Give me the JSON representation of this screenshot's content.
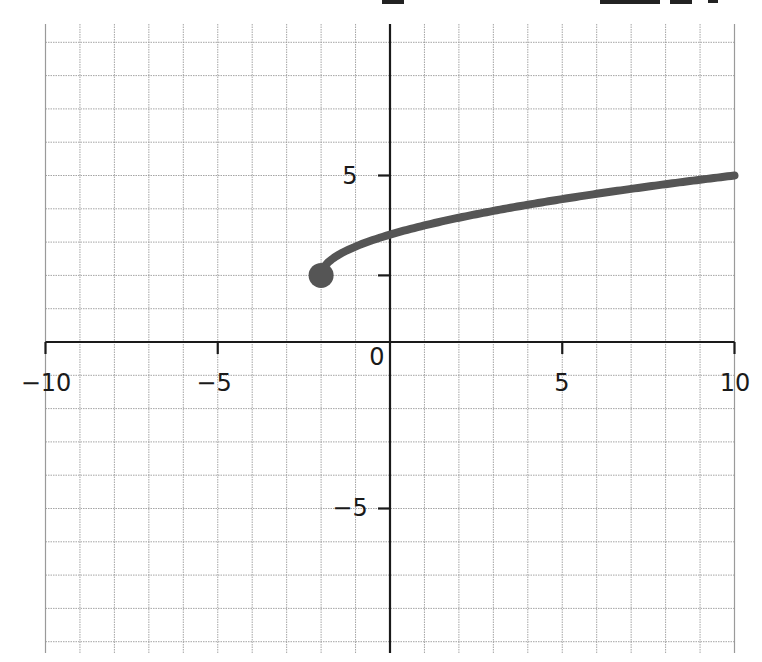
{
  "chart_data": {
    "type": "line",
    "title": "",
    "xlabel": "",
    "ylabel": "",
    "xlim": [
      -10,
      10
    ],
    "ylim": [
      -9.3,
      9.5
    ],
    "grid": true,
    "grid_step": 1,
    "legend": null,
    "x_tick_labels": [
      {
        "value": -10,
        "label": "−10"
      },
      {
        "value": -5,
        "label": "−5"
      },
      {
        "value": 0,
        "label": "0"
      },
      {
        "value": 5,
        "label": "5"
      },
      {
        "value": 10,
        "label": "10"
      }
    ],
    "y_tick_labels": [
      {
        "value": 5,
        "label": "5"
      },
      {
        "value": -5,
        "label": "−5"
      }
    ],
    "y_unlabeled_ticks": [
      2
    ],
    "series": [
      {
        "name": "curve",
        "color": "#555555",
        "start_point": {
          "x": -2,
          "y": 2,
          "style": "closed-dot"
        },
        "x": [
          -2,
          -1.5,
          -1,
          0,
          1,
          2,
          3,
          4,
          5,
          6,
          7,
          8,
          9,
          10
        ],
        "y": [
          2,
          2.61,
          2.87,
          3.22,
          3.5,
          3.73,
          3.94,
          4.12,
          4.29,
          4.45,
          4.6,
          4.74,
          4.87,
          5.0
        ]
      }
    ]
  },
  "labels": {
    "x_neg10": "−10",
    "x_neg5": "−5",
    "origin": "0",
    "x_5": "5",
    "x_10": "10",
    "y_5": "5",
    "y_neg5": "−5"
  }
}
